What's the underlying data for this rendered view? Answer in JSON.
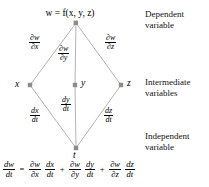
{
  "diagram": {
    "nodes": {
      "top": {
        "label": "w = f(x, y, z)",
        "name": "w"
      },
      "left": {
        "label": "x"
      },
      "middle": {
        "label": "y"
      },
      "right": {
        "label": "z"
      },
      "bottom": {
        "label": "t"
      }
    },
    "edges": [
      {
        "from": "w",
        "to": "x",
        "num": "∂w",
        "den": "∂x"
      },
      {
        "from": "w",
        "to": "y",
        "num": "∂w",
        "den": "∂y"
      },
      {
        "from": "w",
        "to": "z",
        "num": "∂w",
        "den": "∂z"
      },
      {
        "from": "x",
        "to": "t",
        "num": "dx",
        "den": "dt"
      },
      {
        "from": "y",
        "to": "t",
        "num": "dy",
        "den": "dt"
      },
      {
        "from": "z",
        "to": "t",
        "num": "dz",
        "den": "dt"
      }
    ],
    "side_labels": {
      "dependent_line1": "Dependent",
      "dependent_line2": "variable",
      "intermediate_line1": "Intermediate",
      "intermediate_line2": "variables",
      "independent_line1": "Independent",
      "independent_line2": "variable"
    },
    "colors": {
      "line": "#b3b3b3",
      "node": "#8c8c8c",
      "text": "#111111",
      "background": "#ffffff"
    }
  },
  "equation": {
    "lhs": {
      "num": "dw",
      "den": "dt"
    },
    "equals": "=",
    "plus": "+",
    "terms": [
      {
        "partial": {
          "num": "∂w",
          "den": "∂x"
        },
        "ordinary": {
          "num": "dx",
          "den": "dt"
        }
      },
      {
        "partial": {
          "num": "∂w",
          "den": "∂y"
        },
        "ordinary": {
          "num": "dy",
          "den": "dt"
        }
      },
      {
        "partial": {
          "num": "∂w",
          "den": "∂z"
        },
        "ordinary": {
          "num": "dz",
          "den": "dt"
        }
      }
    ]
  }
}
